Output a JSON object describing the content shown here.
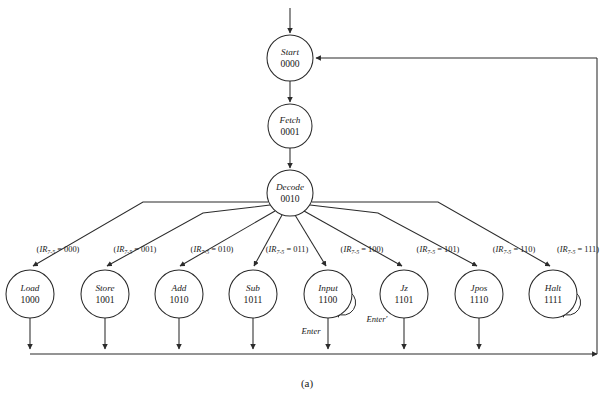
{
  "figure": {
    "caption": "(a)",
    "background": "#ffffff",
    "line_color": "#2b2b2b"
  },
  "states": [
    {
      "id": "start",
      "name": "Start",
      "code": "0000",
      "cx": 290,
      "cy": 58,
      "r": 23
    },
    {
      "id": "fetch",
      "name": "Fetch",
      "code": "0001",
      "cx": 290,
      "cy": 126,
      "r": 22
    },
    {
      "id": "decode",
      "name": "Decode",
      "code": "0010",
      "cx": 290,
      "cy": 193,
      "r": 23
    },
    {
      "id": "load",
      "name": "Load",
      "code": "1000",
      "cx": 30,
      "cy": 294,
      "r": 24
    },
    {
      "id": "store",
      "name": "Store",
      "code": "1001",
      "cx": 105,
      "cy": 294,
      "r": 24
    },
    {
      "id": "add",
      "name": "Add",
      "code": "1010",
      "cx": 179,
      "cy": 294,
      "r": 24
    },
    {
      "id": "sub",
      "name": "Sub",
      "code": "1011",
      "cx": 253,
      "cy": 294,
      "r": 24
    },
    {
      "id": "input",
      "name": "Input",
      "code": "1100",
      "cx": 328,
      "cy": 294,
      "r": 24
    },
    {
      "id": "jz",
      "name": "Jz",
      "code": "1101",
      "cx": 404,
      "cy": 294,
      "r": 24
    },
    {
      "id": "jpos",
      "name": "Jpos",
      "code": "1110",
      "cx": 479,
      "cy": 294,
      "r": 24
    },
    {
      "id": "halt",
      "name": "Halt",
      "code": "1111",
      "cx": 553,
      "cy": 294,
      "r": 24
    }
  ],
  "conditions": [
    {
      "target": "load",
      "prefix": "(",
      "reg": "IR",
      "sub": "7-5",
      "value": " = 000)",
      "x": 58,
      "y": 252
    },
    {
      "target": "store",
      "prefix": "(",
      "reg": "IR",
      "sub": "7-5",
      "value": " = 001)",
      "x": 135,
      "y": 252
    },
    {
      "target": "add",
      "prefix": "(",
      "reg": "IR",
      "sub": "7-5",
      "value": " = 010)",
      "x": 212,
      "y": 252
    },
    {
      "target": "sub",
      "prefix": "(",
      "reg": "IR",
      "sub": "7-5",
      "value": " = 011)",
      "x": 287,
      "y": 252
    },
    {
      "target": "input",
      "prefix": "(",
      "reg": "IR",
      "sub": "7-5",
      "value": " = 100)",
      "x": 362,
      "y": 252
    },
    {
      "target": "jz",
      "prefix": "(",
      "reg": "IR",
      "sub": "7-5",
      "value": " = 101)",
      "x": 438,
      "y": 252
    },
    {
      "target": "jpos",
      "prefix": "(",
      "reg": "IR",
      "sub": "7-5",
      "value": " = 110)",
      "x": 514,
      "y": 252
    },
    {
      "target": "halt",
      "prefix": "(",
      "reg": "IR",
      "sub": "7-5",
      "value": " = 111)",
      "x": 578,
      "y": 252
    }
  ],
  "signals": [
    {
      "id": "enter-prime",
      "text": "Enter′",
      "x": 377,
      "y": 322
    },
    {
      "id": "enter",
      "text": "Enter",
      "x": 311,
      "y": 334
    }
  ]
}
